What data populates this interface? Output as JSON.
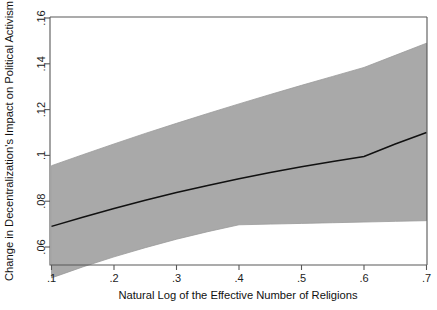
{
  "chart_data": {
    "type": "line",
    "title": "",
    "subtitle": "",
    "xlabel": "Natural Log of the Effective Number of Religions",
    "ylabel": "Change in Decentralization's Impact on Political Activism",
    "xlim": [
      0.1,
      0.7
    ],
    "ylim": [
      0.045,
      0.162
    ],
    "xticks": [
      0.1,
      0.2,
      0.3,
      0.4,
      0.5,
      0.6,
      0.7
    ],
    "xticklabels": [
      ".1",
      ".2",
      ".3",
      ".4",
      ".5",
      ".6",
      ".7"
    ],
    "yticks": [
      0.06,
      0.08,
      0.1,
      0.12,
      0.14,
      0.16
    ],
    "yticklabels": [
      ".06",
      ".08",
      ".1",
      ".12",
      ".14",
      ".16"
    ],
    "grid": false,
    "legend": null,
    "legend_position": "none",
    "annotations": [],
    "series": [
      {
        "name": "Marginal effect",
        "kind": "line",
        "color": "#111111",
        "x": [
          0.1,
          0.15,
          0.2,
          0.25,
          0.3,
          0.35,
          0.4,
          0.45,
          0.5,
          0.55,
          0.6,
          0.65,
          0.7
        ],
        "values": [
          0.069,
          0.073,
          0.0768,
          0.0804,
          0.0838,
          0.0869,
          0.0898,
          0.0925,
          0.095,
          0.0973,
          0.0995,
          0.105,
          0.11
        ]
      },
      {
        "name": "95% confidence interval upper bound",
        "kind": "band-upper",
        "color": "#a9a9a9",
        "x": [
          0.1,
          0.15,
          0.2,
          0.25,
          0.3,
          0.35,
          0.4,
          0.45,
          0.5,
          0.55,
          0.6,
          0.65,
          0.7
        ],
        "values": [
          0.0955,
          0.1003,
          0.105,
          0.1096,
          0.114,
          0.1183,
          0.1225,
          0.1266,
          0.1306,
          0.1345,
          0.1384,
          0.1437,
          0.149
        ]
      },
      {
        "name": "95% confidence interval lower bound",
        "kind": "band-lower",
        "color": "#a9a9a9",
        "x": [
          0.1,
          0.15,
          0.2,
          0.25,
          0.3,
          0.35,
          0.4,
          0.45,
          0.5,
          0.55,
          0.6,
          0.65,
          0.7
        ],
        "values": [
          0.0465,
          0.0513,
          0.0557,
          0.0597,
          0.0634,
          0.0667,
          0.0697,
          0.07,
          0.0703,
          0.0706,
          0.0709,
          0.0712,
          0.0715
        ]
      }
    ],
    "colors": {
      "band": "#a9a9a9",
      "line": "#111111",
      "axis": "#585858",
      "text": "#1c1c1c",
      "background": "#ffffff"
    }
  }
}
